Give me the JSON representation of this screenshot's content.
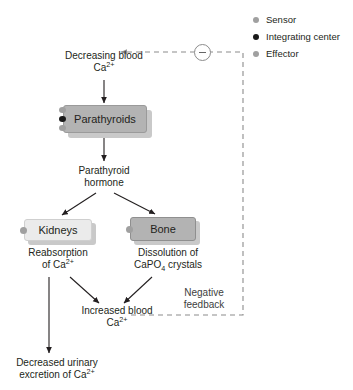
{
  "diagram": {
    "colors": {
      "sensor": "#a0a0a0",
      "integrating_center": "#1a1a1a",
      "effector": "#a0a0a0",
      "box_dark": "#b3b3b3",
      "box_light": "#ebebeb",
      "stroke": "#231f20",
      "dashed": "#8c8c8c"
    }
  },
  "legend": {
    "items": [
      {
        "label": "Sensor",
        "dot": "#a0a0a0",
        "role": "sensor"
      },
      {
        "label": "Integrating center",
        "dot": "#1a1a1a",
        "role": "integrating-center"
      },
      {
        "label": "Effector",
        "dot": "#a0a0a0",
        "role": "effector"
      }
    ]
  },
  "nodes": {
    "stimulus": {
      "line1": "Decreasing blood",
      "line2_main": "Ca",
      "line2_sup": "2+"
    },
    "parathyroids": {
      "label": "Parathyroids"
    },
    "hormone": {
      "line1": "Parathyroid",
      "line2": "hormone"
    },
    "kidneys": {
      "label": "Kidneys"
    },
    "bone": {
      "label": "Bone"
    },
    "reabsorption": {
      "line1": "Reabsorption",
      "line2_pre": "of Ca",
      "line2_sup": "2+"
    },
    "dissolution": {
      "line1": "Dissolution of",
      "line2_pre": "CaPO",
      "line2_sub": "4",
      "line2_post": " crystals"
    },
    "increased": {
      "line1": "Increased blood",
      "line2_main": "Ca",
      "line2_sup": "2+"
    },
    "excretion": {
      "line1": "Decreased urinary",
      "line2_pre": "excretion of Ca",
      "line2_sup": "2+"
    },
    "feedback": {
      "line1": "Negative",
      "line2": "feedback"
    },
    "minus_badge": {
      "symbol": "minus",
      "meaning": "inhibition"
    }
  }
}
